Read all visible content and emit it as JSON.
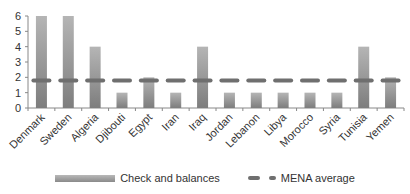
{
  "chart_data": {
    "type": "bar",
    "title": "",
    "xlabel": "",
    "ylabel": "",
    "ylim": [
      0,
      6
    ],
    "yticks": [
      0,
      1,
      2,
      3,
      4,
      5,
      6
    ],
    "grid": false,
    "legend_position": "bottom",
    "categories": [
      "Denmark",
      "Sweden",
      "Algeria",
      "Djibouti",
      "Egypt",
      "Iran",
      "Iraq",
      "Jordan",
      "Lebanon",
      "Libya",
      "Morocco",
      "Syria",
      "Tunisia",
      "Yemen"
    ],
    "series": [
      {
        "name": "Check and balances",
        "kind": "bar",
        "values": [
          6,
          6,
          4,
          1,
          2,
          1,
          4,
          1,
          1,
          1,
          1,
          1,
          4,
          2
        ]
      },
      {
        "name": "MENA average",
        "kind": "dashed-line",
        "values": [
          1.8,
          1.8,
          1.8,
          1.8,
          1.8,
          1.8,
          1.8,
          1.8,
          1.8,
          1.8,
          1.8,
          1.8,
          1.8,
          1.8
        ]
      }
    ],
    "colors": {
      "bar_top": "#b5b5b5",
      "bar_bottom": "#7d7d7d",
      "average_line": "#6f6f6f",
      "axis": "#888888"
    }
  },
  "legend": {
    "bars_label": "Check and balances",
    "line_label": "MENA average"
  }
}
